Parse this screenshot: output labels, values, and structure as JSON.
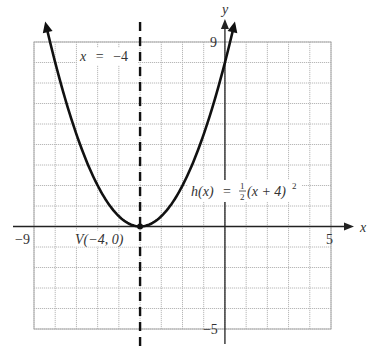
{
  "chart_data": {
    "type": "line",
    "title": "",
    "function_label": {
      "name": "h(x)",
      "equals": "=",
      "coef_num": "1",
      "coef_den": "2",
      "body": "(x + 4)",
      "exponent": "2"
    },
    "xlabel": "x",
    "ylabel": "y",
    "xlim": [
      -9,
      5
    ],
    "ylim": [
      -5,
      9
    ],
    "x_tick_labels": [
      {
        "value": -9,
        "text": "−9"
      },
      {
        "value": 5,
        "text": "5"
      }
    ],
    "y_tick_labels": [
      {
        "value": 9,
        "text": "9"
      },
      {
        "value": -5,
        "text": "−5"
      }
    ],
    "grid": true,
    "grid_step": 1,
    "series": [
      {
        "name": "h(x) = 1/2 (x + 4)^2",
        "kind": "parabola",
        "a": 0.5,
        "h": -4,
        "k": 0,
        "x_range": [
          -8.43,
          0.43
        ],
        "arrows": "both-ends",
        "color": "#111111"
      }
    ],
    "axis_of_symmetry": {
      "x": -4,
      "label_var": "x",
      "label_eq": "=",
      "label_val": "−4",
      "style": "dashed"
    },
    "vertex": {
      "x": -4,
      "y": 0,
      "label": "V(−4, 0)"
    }
  }
}
